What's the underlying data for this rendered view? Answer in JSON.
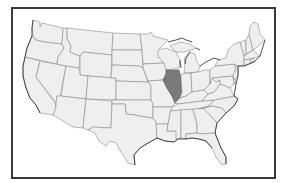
{
  "map": {
    "title": "Contiguous United States",
    "highlighted_state": "Illinois",
    "colors": {
      "highlight": "#7a7a7a",
      "state_fill": "#efefef",
      "state_border": "#8a8a8a",
      "frame": "#3a3a3a",
      "background": "#ffffff"
    },
    "states": [
      {
        "id": "WA",
        "name": "Washington",
        "highlighted": false
      },
      {
        "id": "OR",
        "name": "Oregon",
        "highlighted": false
      },
      {
        "id": "CA",
        "name": "California",
        "highlighted": false
      },
      {
        "id": "ID",
        "name": "Idaho",
        "highlighted": false
      },
      {
        "id": "NV",
        "name": "Nevada",
        "highlighted": false
      },
      {
        "id": "MT",
        "name": "Montana",
        "highlighted": false
      },
      {
        "id": "WY",
        "name": "Wyoming",
        "highlighted": false
      },
      {
        "id": "UT",
        "name": "Utah",
        "highlighted": false
      },
      {
        "id": "AZ",
        "name": "Arizona",
        "highlighted": false
      },
      {
        "id": "CO",
        "name": "Colorado",
        "highlighted": false
      },
      {
        "id": "NM",
        "name": "New Mexico",
        "highlighted": false
      },
      {
        "id": "ND",
        "name": "North Dakota",
        "highlighted": false
      },
      {
        "id": "SD",
        "name": "South Dakota",
        "highlighted": false
      },
      {
        "id": "NE",
        "name": "Nebraska",
        "highlighted": false
      },
      {
        "id": "KS",
        "name": "Kansas",
        "highlighted": false
      },
      {
        "id": "OK",
        "name": "Oklahoma",
        "highlighted": false
      },
      {
        "id": "TX",
        "name": "Texas",
        "highlighted": false
      },
      {
        "id": "MN",
        "name": "Minnesota",
        "highlighted": false
      },
      {
        "id": "IA",
        "name": "Iowa",
        "highlighted": false
      },
      {
        "id": "MO",
        "name": "Missouri",
        "highlighted": false
      },
      {
        "id": "AR",
        "name": "Arkansas",
        "highlighted": false
      },
      {
        "id": "LA",
        "name": "Louisiana",
        "highlighted": false
      },
      {
        "id": "WI",
        "name": "Wisconsin",
        "highlighted": false
      },
      {
        "id": "IL",
        "name": "Illinois",
        "highlighted": true
      },
      {
        "id": "MI",
        "name": "Michigan",
        "highlighted": false
      },
      {
        "id": "IN",
        "name": "Indiana",
        "highlighted": false
      },
      {
        "id": "OH",
        "name": "Ohio",
        "highlighted": false
      },
      {
        "id": "KY",
        "name": "Kentucky",
        "highlighted": false
      },
      {
        "id": "TN",
        "name": "Tennessee",
        "highlighted": false
      },
      {
        "id": "MS",
        "name": "Mississippi",
        "highlighted": false
      },
      {
        "id": "AL",
        "name": "Alabama",
        "highlighted": false
      },
      {
        "id": "GA",
        "name": "Georgia",
        "highlighted": false
      },
      {
        "id": "FL",
        "name": "Florida",
        "highlighted": false
      },
      {
        "id": "SC",
        "name": "South Carolina",
        "highlighted": false
      },
      {
        "id": "NC",
        "name": "North Carolina",
        "highlighted": false
      },
      {
        "id": "VA",
        "name": "Virginia",
        "highlighted": false
      },
      {
        "id": "WV",
        "name": "West Virginia",
        "highlighted": false
      },
      {
        "id": "PA",
        "name": "Pennsylvania",
        "highlighted": false
      },
      {
        "id": "NY",
        "name": "New York",
        "highlighted": false
      },
      {
        "id": "NJ",
        "name": "New Jersey",
        "highlighted": false
      },
      {
        "id": "DE",
        "name": "Delaware",
        "highlighted": false
      },
      {
        "id": "MD",
        "name": "Maryland",
        "highlighted": false
      },
      {
        "id": "CT",
        "name": "Connecticut",
        "highlighted": false
      },
      {
        "id": "RI",
        "name": "Rhode Island",
        "highlighted": false
      },
      {
        "id": "MA",
        "name": "Massachusetts",
        "highlighted": false
      },
      {
        "id": "VT",
        "name": "Vermont",
        "highlighted": false
      },
      {
        "id": "NH",
        "name": "New Hampshire",
        "highlighted": false
      },
      {
        "id": "ME",
        "name": "Maine",
        "highlighted": false
      }
    ]
  }
}
